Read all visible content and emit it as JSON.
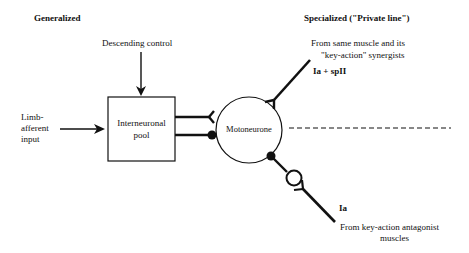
{
  "headings": {
    "left": "Generalized",
    "right": "Specialized (\"Private line\")"
  },
  "labels": {
    "descending_control": "Descending control",
    "limb_afferent_1": "Limb-",
    "limb_afferent_2": "afferent",
    "limb_afferent_3": "input",
    "interneuronal_1": "Interneuronal",
    "interneuronal_2": "pool",
    "motoneurone": "Motoneurone",
    "synergist_1": "From same muscle and its",
    "synergist_2": "\"key-action\" synergists",
    "ia_spii": "Ia + spII",
    "ia": "Ia",
    "antagonist_1": "From key-action antagonist",
    "antagonist_2": "muscles"
  },
  "colors": {
    "stroke": "#111111",
    "background": "#ffffff"
  }
}
